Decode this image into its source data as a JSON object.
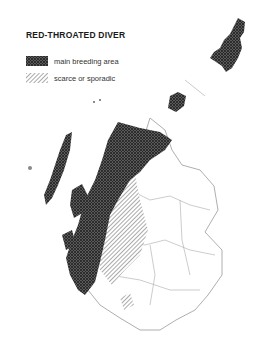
{
  "title": "RED-THROATED DIVER",
  "legend": {
    "items": [
      {
        "label": "main breeding area",
        "pattern": "crosshatch"
      },
      {
        "label": "scarce or sporadic",
        "pattern": "diagonal"
      }
    ]
  },
  "colors": {
    "main": "#4a4a4a",
    "scarce": "#777777",
    "outline": "#9a9a9a"
  }
}
